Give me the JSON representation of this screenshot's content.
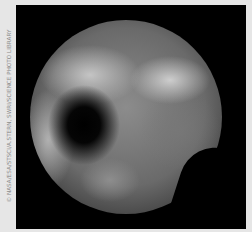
{
  "image": {
    "subject": "Pluto (Hubble image)",
    "credit": "© NASA/ESA/STSCI/A.STERN, SWRI/SCIENCE PHOTO LIBRARY",
    "colors": {
      "border": "#e6e6e6",
      "frame": "#000000",
      "credit_text": "#8a8a8a"
    }
  }
}
